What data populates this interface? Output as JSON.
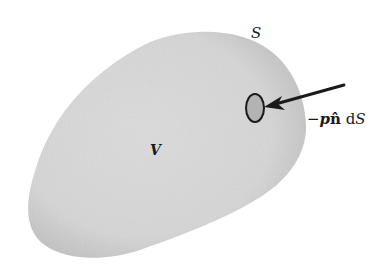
{
  "figure": {
    "labels": {
      "surface": "S",
      "volume": "V",
      "force_minus": "−",
      "force_p": "p",
      "force_nhat": "n̂",
      "force_d": " d",
      "force_S": "S"
    },
    "colors": {
      "background": "#ffffff",
      "body_fill": "#d9d9d9",
      "body_shade": "#c4c4c4",
      "patch_fill": "#b5b5b5",
      "stroke": "#1a1a1a"
    },
    "elements": {
      "body": "closed-volume-blob",
      "patch": "surface-element-dS",
      "arrow": "pressure-force-arrow"
    }
  }
}
